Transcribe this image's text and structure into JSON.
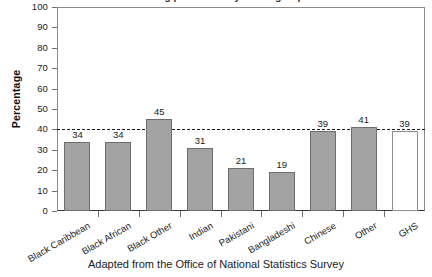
{
  "figure": {
    "title_cropped": "Smoking prevalence by ethnic group",
    "caption": "Adapted from the Office of National Statistics Survey"
  },
  "axes": {
    "ylabel": "Percentage",
    "yticks": [
      0,
      10,
      20,
      30,
      40,
      50,
      60,
      70,
      80,
      90,
      100
    ]
  },
  "colors": {
    "bar_fill": "#a3a3a3",
    "bar_edge": "#6d6d6d",
    "hollow_fill": "#ffffff",
    "hollow_edge": "#8f8f8f",
    "reference_line": "#1b1b1b",
    "axis": "#3a3a3a",
    "background": "#ffffff"
  },
  "chart_data": {
    "type": "bar",
    "title": "Smoking prevalence by ethnic group",
    "xlabel": "",
    "ylabel": "Percentage",
    "ylim": [
      0,
      100
    ],
    "ytick_step": 10,
    "grid": false,
    "legend": "none",
    "categories": [
      "Black Caribbean",
      "Black African",
      "Black Other",
      "Indian",
      "Pakistani",
      "Bangladeshi",
      "Chinese",
      "Other",
      "GHS"
    ],
    "values": [
      34,
      34,
      45,
      31,
      21,
      19,
      39,
      41,
      39
    ],
    "bar_styles": [
      "filled",
      "filled",
      "filled",
      "filled",
      "filled",
      "filled",
      "filled",
      "filled",
      "hollow"
    ],
    "annotations": [
      {
        "type": "reference_line",
        "orientation": "horizontal",
        "value": 40,
        "style": "dashed",
        "label": ""
      }
    ]
  }
}
